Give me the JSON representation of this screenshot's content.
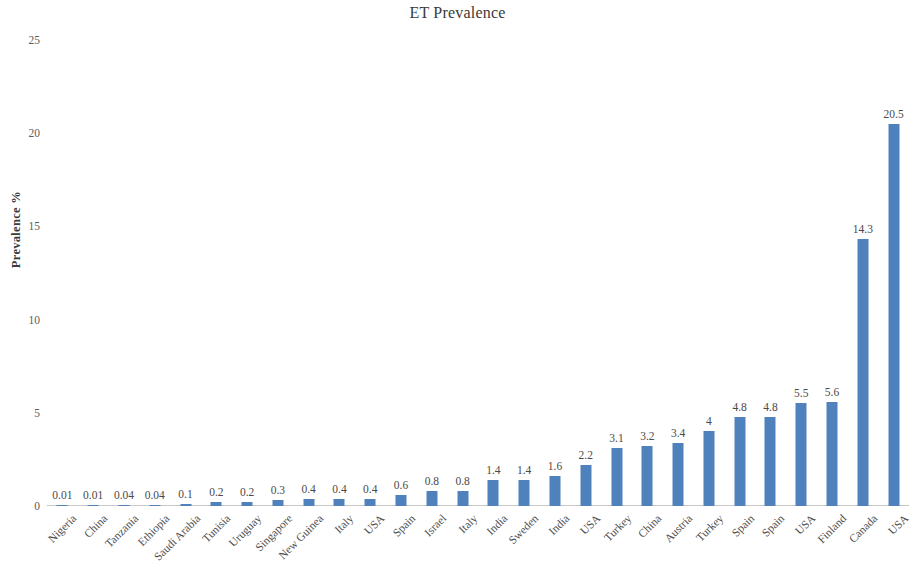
{
  "chart_data": {
    "type": "bar",
    "title": "ET Prevalence",
    "xlabel": "",
    "ylabel": "Prevalence %",
    "ylim": [
      0,
      25
    ],
    "yticks": [
      0,
      5,
      10,
      15,
      20,
      25
    ],
    "ytick_labels": [
      "0",
      "5",
      "10",
      "15",
      "20",
      "25"
    ],
    "grid": false,
    "legend": false,
    "bar_color": "#4f81bd",
    "categories": [
      "Nigeria",
      "China",
      "Tanzania",
      "Ethiopia",
      "Saudi Arabia",
      "Tunisia",
      "Uruguay",
      "Singapore",
      "New Guinea",
      "Italy",
      "USA",
      "Spain",
      "Israel",
      "Italy",
      "India",
      "Sweden",
      "India",
      "USA",
      "Turkey",
      "China",
      "Austria",
      "Turkey",
      "Spain",
      "Spain",
      "USA",
      "Finland",
      "Canada",
      "USA"
    ],
    "values": [
      0.01,
      0.01,
      0.04,
      0.04,
      0.1,
      0.2,
      0.2,
      0.3,
      0.4,
      0.4,
      0.4,
      0.6,
      0.8,
      0.8,
      1.4,
      1.4,
      1.6,
      2.2,
      3.1,
      3.2,
      3.4,
      4,
      4.8,
      4.8,
      5.5,
      5.6,
      14.3,
      20.5
    ],
    "data_labels": [
      "0.01",
      "0.01",
      "0.04",
      "0.04",
      "0.1",
      "0.2",
      "0.2",
      "0.3",
      "0.4",
      "0.4",
      "0.4",
      "0.6",
      "0.8",
      "0.8",
      "1.4",
      "1.4",
      "1.6",
      "2.2",
      "3.1",
      "3.2",
      "3.4",
      "4",
      "4.8",
      "4.8",
      "5.5",
      "5.6",
      "14.3",
      "20.5"
    ]
  }
}
